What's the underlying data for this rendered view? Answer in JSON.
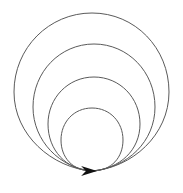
{
  "figure": {
    "background_color": "#ffffff",
    "width": 183,
    "height": 193,
    "stroke_color": "#5a5a5a",
    "arrow_color": "#111111",
    "stroke_width": 1,
    "convergence_point": {
      "x": 92,
      "y": 171
    },
    "arrow_direction": "right",
    "loop_count": 4
  },
  "chart_data": {
    "type": "line",
    "subtitle": "",
    "xlabel": "",
    "ylabel": "",
    "grid": false,
    "legend": "none",
    "xlim": [
      0,
      183
    ],
    "ylim": [
      0,
      193
    ],
    "annotations": [
      {
        "name": "arrowhead",
        "x": 92,
        "y": 171,
        "direction": "right",
        "length": 16,
        "half_width": 5
      }
    ],
    "series": [
      {
        "name": "loop-1-innermost",
        "top_y": 108,
        "left_x": 61,
        "right_x": 122,
        "bottom_y": 171,
        "radius_x": 30,
        "radius_y": 32,
        "center_x": 92,
        "center_y": 140,
        "path": "M 92,171 C 72,171 61,157 61,140 C 61,122 74,108 92,108 C 110,108 123,122 123,140 C 123,157 112,171 92,171 Z"
      },
      {
        "name": "loop-2",
        "top_y": 77,
        "left_x": 48,
        "right_x": 140,
        "bottom_y": 171,
        "radius_x": 46,
        "radius_y": 47,
        "center_x": 94,
        "center_y": 124,
        "path": "M 92,171 C 66,170 48,150 48,124 C 48,98 68,77 94,77 C 120,77 140,98 140,124 C 140,150 120,169 92,171 Z"
      },
      {
        "name": "loop-3",
        "top_y": 44,
        "left_x": 33,
        "right_x": 155,
        "bottom_y": 171,
        "radius_x": 61,
        "radius_y": 63,
        "center_x": 94,
        "center_y": 107,
        "path": "M 92,171 C 60,168 33,141 33,107 C 33,72 60,44 94,44 C 128,44 155,72 155,107 C 155,141 128,168 92,171 Z"
      },
      {
        "name": "loop-4-outermost",
        "top_y": 13,
        "left_x": 14,
        "right_x": 169,
        "bottom_y": 171,
        "radius_x": 77,
        "radius_y": 79,
        "center_x": 92,
        "center_y": 92,
        "path": "M 92,171 C 52,168 14,135 14,92 C 14,48 49,13 92,13 C 135,13 169,48 169,92 C 169,135 132,168 92,171 Z"
      }
    ]
  }
}
